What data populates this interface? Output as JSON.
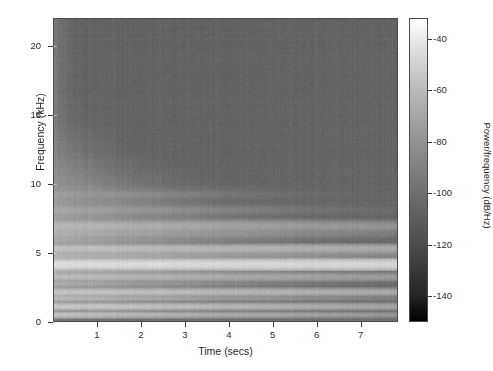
{
  "figure": {
    "background_color": "#ffffff",
    "axis_color": "#3a3a3a"
  },
  "chart_data": {
    "type": "heatmap",
    "title": "",
    "subtitle": "",
    "xlabel": "Time (secs)",
    "ylabel": "Frequency (kHz)",
    "xlim": [
      0,
      7.85
    ],
    "ylim": [
      0,
      22.05
    ],
    "xticks": [
      1,
      2,
      3,
      4,
      5,
      6,
      7
    ],
    "xtick_labels": [
      "1",
      "2",
      "3",
      "4",
      "5",
      "6",
      "7"
    ],
    "yticks": [
      0,
      5,
      10,
      15,
      20
    ],
    "ytick_labels": [
      "0",
      "5",
      "10",
      "15",
      "20"
    ],
    "grid": false,
    "legend_position": "right",
    "colormap": "gray",
    "colorbar": {
      "label": "Power/frequency (dB/Hz)",
      "ticks": [
        -40,
        -60,
        -80,
        -100,
        -120,
        -140
      ],
      "tick_labels": [
        "-40",
        "-60",
        "-80",
        "-100",
        "-120",
        "-140"
      ],
      "vmin": -150,
      "vmax": -32,
      "low_color": "#000000",
      "high_color": "#ffffff"
    },
    "noise_floor_db": -105,
    "harmonics": [
      {
        "freq_khz": 0.45,
        "peak_db": -62,
        "decay_secs": 1.6
      },
      {
        "freq_khz": 1.05,
        "peak_db": -58,
        "decay_secs": 1.9
      },
      {
        "freq_khz": 1.65,
        "peak_db": -66,
        "decay_secs": 1.2
      },
      {
        "freq_khz": 2.1,
        "peak_db": -60,
        "decay_secs": 2.4
      },
      {
        "freq_khz": 2.7,
        "peak_db": -72,
        "decay_secs": 1.0
      },
      {
        "freq_khz": 3.2,
        "peak_db": -64,
        "decay_secs": 2.1
      },
      {
        "freq_khz": 3.65,
        "peak_db": -70,
        "decay_secs": 1.1
      },
      {
        "freq_khz": 4.1,
        "peak_db": -48,
        "decay_secs": 9.0
      },
      {
        "freq_khz": 4.7,
        "peak_db": -68,
        "decay_secs": 1.5
      },
      {
        "freq_khz": 5.25,
        "peak_db": -62,
        "decay_secs": 2.8
      },
      {
        "freq_khz": 5.9,
        "peak_db": -74,
        "decay_secs": 0.9
      },
      {
        "freq_khz": 6.4,
        "peak_db": -70,
        "decay_secs": 1.3
      },
      {
        "freq_khz": 6.95,
        "peak_db": -66,
        "decay_secs": 1.8
      },
      {
        "freq_khz": 7.55,
        "peak_db": -78,
        "decay_secs": 0.8
      },
      {
        "freq_khz": 8.1,
        "peak_db": -74,
        "decay_secs": 1.0
      },
      {
        "freq_khz": 8.7,
        "peak_db": -80,
        "decay_secs": 0.7
      },
      {
        "freq_khz": 9.25,
        "peak_db": -78,
        "decay_secs": 0.9
      },
      {
        "freq_khz": 9.85,
        "peak_db": -84,
        "decay_secs": 0.6
      },
      {
        "freq_khz": 10.4,
        "peak_db": -86,
        "decay_secs": 0.6
      },
      {
        "freq_khz": 11.0,
        "peak_db": -88,
        "decay_secs": 0.5
      },
      {
        "freq_khz": 11.6,
        "peak_db": -90,
        "decay_secs": 0.5
      },
      {
        "freq_khz": 12.2,
        "peak_db": -92,
        "decay_secs": 0.4
      },
      {
        "freq_khz": 12.85,
        "peak_db": -94,
        "decay_secs": 0.4
      },
      {
        "freq_khz": 13.5,
        "peak_db": -96,
        "decay_secs": 0.35
      },
      {
        "freq_khz": 14.2,
        "peak_db": -98,
        "decay_secs": 0.3
      },
      {
        "freq_khz": 15.0,
        "peak_db": -100,
        "decay_secs": 0.3
      },
      {
        "freq_khz": 16.1,
        "peak_db": -101,
        "decay_secs": 0.25
      },
      {
        "freq_khz": 17.3,
        "peak_db": -102,
        "decay_secs": 0.2
      },
      {
        "freq_khz": 18.6,
        "peak_db": -103,
        "decay_secs": 0.2
      },
      {
        "freq_khz": 20.1,
        "peak_db": -103,
        "decay_secs": 0.18
      }
    ],
    "broadband_onset": {
      "time_secs": 0.0,
      "level_db": -96,
      "duration_secs": 0.12
    }
  }
}
